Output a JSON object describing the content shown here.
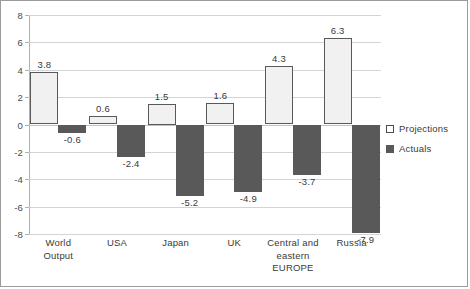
{
  "chart_data": {
    "type": "bar",
    "title": "",
    "subtitle": "",
    "xlabel": "",
    "ylabel": "",
    "ylim": [
      -8,
      8
    ],
    "ytick_step": 2,
    "yticks": [
      "8",
      "6",
      "4",
      "2",
      "0",
      "-2",
      "-4",
      "-6",
      "-8"
    ],
    "grid": true,
    "legend_position": "right",
    "categories": [
      "World Output",
      "USA",
      "Japan",
      "UK",
      "Central and eastern EUROPE",
      "Russia"
    ],
    "category_lines": [
      [
        "World",
        "Output"
      ],
      [
        "USA"
      ],
      [
        "Japan"
      ],
      [
        "UK"
      ],
      [
        "Central and",
        "eastern",
        "EUROPE"
      ],
      [
        "Russia"
      ]
    ],
    "series": [
      {
        "name": "Projections",
        "color": "#f1f1f1",
        "border_color": "#595959",
        "values": [
          3.8,
          0.6,
          1.5,
          1.6,
          4.3,
          6.3
        ],
        "labels": [
          "3.8",
          "0.6",
          "1.5",
          "1.6",
          "4.3",
          "6.3"
        ]
      },
      {
        "name": "Actuals",
        "color": "#595959",
        "border_color": "#595959",
        "values": [
          -0.6,
          -2.4,
          -5.2,
          -4.9,
          -3.7,
          -7.9
        ],
        "labels": [
          "-0.6",
          "-2.4",
          "-5.2",
          "-4.9",
          "-3.7",
          "-7.9"
        ]
      }
    ]
  },
  "legend": {
    "items": [
      {
        "label": "Projections",
        "swatch": "legend-swatch-projections"
      },
      {
        "label": "Actuals",
        "swatch": "legend-swatch-actuals"
      }
    ]
  }
}
